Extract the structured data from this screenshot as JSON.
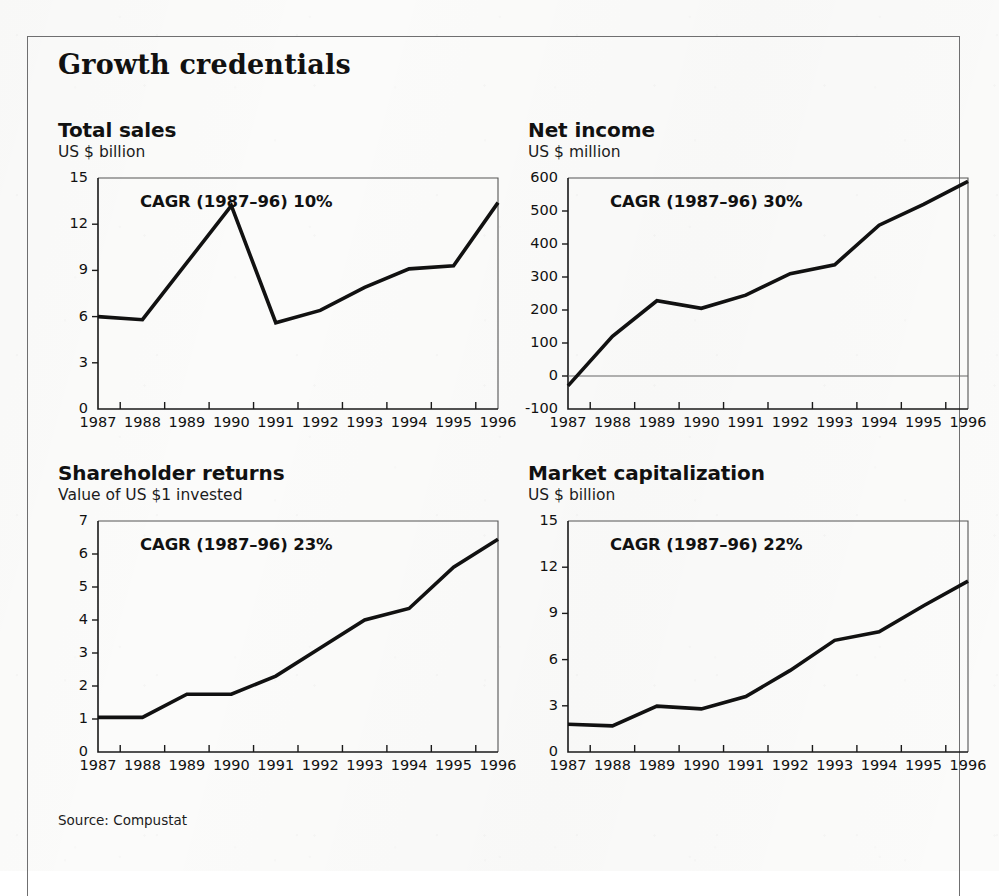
{
  "exhibit": {
    "title": "Growth credentials",
    "source": "Source: Compustat"
  },
  "charts": [
    {
      "id": "total-sales",
      "title": "Total sales",
      "subtitle": "US $ billion",
      "cagr": "CAGR (1987–96) 10%"
    },
    {
      "id": "net-income",
      "title": "Net income",
      "subtitle": "US $ million",
      "cagr": "CAGR (1987–96) 30%"
    },
    {
      "id": "shareholder-returns",
      "title": "Shareholder returns",
      "subtitle": "Value of US $1 invested",
      "cagr": "CAGR (1987–96) 23%"
    },
    {
      "id": "market-capitalization",
      "title": "Market capitalization",
      "subtitle": "US $ billion",
      "cagr": "CAGR (1987–96) 22%"
    }
  ],
  "chart_data": [
    {
      "type": "line",
      "id": "total-sales",
      "title": "Total sales",
      "subtitle": "US $ billion",
      "annotation": "CAGR (1987–96) 10%",
      "xlabel": "",
      "ylabel": "US $ billion",
      "categories": [
        1987,
        1988,
        1989,
        1990,
        1991,
        1992,
        1993,
        1994,
        1995,
        1996
      ],
      "x": [
        "1987",
        "1988",
        "1989",
        "1990",
        "1991",
        "1992",
        "1993",
        "1994",
        "1995",
        "1996"
      ],
      "values": [
        6.0,
        5.8,
        9.5,
        13.2,
        5.6,
        6.4,
        7.9,
        9.1,
        9.3,
        13.4
      ],
      "ylim": [
        0,
        15
      ],
      "yticks": [
        0,
        3,
        6,
        9,
        12,
        15
      ],
      "grid": false,
      "legend": null
    },
    {
      "type": "line",
      "id": "net-income",
      "title": "Net income",
      "subtitle": "US $ million",
      "annotation": "CAGR (1987–96) 30%",
      "xlabel": "",
      "ylabel": "US $ million",
      "categories": [
        1987,
        1988,
        1989,
        1990,
        1991,
        1992,
        1993,
        1994,
        1995,
        1996
      ],
      "x": [
        "1987",
        "1988",
        "1989",
        "1990",
        "1991",
        "1992",
        "1993",
        "1994",
        "1995",
        "1996"
      ],
      "values": [
        -30,
        120,
        228,
        205,
        245,
        310,
        337,
        457,
        520,
        590
      ],
      "ylim": [
        -100,
        600
      ],
      "yticks": [
        -100,
        0,
        100,
        200,
        300,
        400,
        500,
        600
      ],
      "grid": false,
      "zero_line": 0,
      "legend": null
    },
    {
      "type": "line",
      "id": "shareholder-returns",
      "title": "Shareholder returns",
      "subtitle": "Value of US $1 invested",
      "annotation": "CAGR (1987–96) 23%",
      "xlabel": "",
      "ylabel": "Value of US $1 invested",
      "categories": [
        1987,
        1988,
        1989,
        1990,
        1991,
        1992,
        1993,
        1994,
        1995,
        1996
      ],
      "x": [
        "1987",
        "1988",
        "1989",
        "1990",
        "1991",
        "1992",
        "1993",
        "1994",
        "1995",
        "1996"
      ],
      "values": [
        1.05,
        1.05,
        1.75,
        1.75,
        2.3,
        3.15,
        4.0,
        4.35,
        5.6,
        6.45
      ],
      "ylim": [
        0,
        7
      ],
      "yticks": [
        0,
        1,
        2,
        3,
        4,
        5,
        6,
        7
      ],
      "grid": false,
      "legend": null
    },
    {
      "type": "line",
      "id": "market-capitalization",
      "title": "Market capitalization",
      "subtitle": "US $ billion",
      "annotation": "CAGR (1987–96) 22%",
      "xlabel": "",
      "ylabel": "US $ billion",
      "categories": [
        1987,
        1988,
        1989,
        1990,
        1991,
        1992,
        1993,
        1994,
        1995,
        1996
      ],
      "x": [
        "1987",
        "1988",
        "1989",
        "1990",
        "1991",
        "1992",
        "1993",
        "1994",
        "1995",
        "1996"
      ],
      "values": [
        1.8,
        1.7,
        2.98,
        2.8,
        3.6,
        5.3,
        7.25,
        7.8,
        9.5,
        11.1
      ],
      "ylim": [
        0,
        15
      ],
      "yticks": [
        0,
        3,
        6,
        9,
        12,
        15
      ],
      "grid": false,
      "legend": null
    }
  ],
  "layout": {
    "panels": [
      {
        "left": 58,
        "top": 118
      },
      {
        "left": 528,
        "top": 118
      },
      {
        "left": 58,
        "top": 461
      },
      {
        "left": 528,
        "top": 461
      }
    ],
    "plot_width": 400,
    "plot_height": 231,
    "cagr_offset": {
      "left": 42,
      "top": 14
    }
  }
}
